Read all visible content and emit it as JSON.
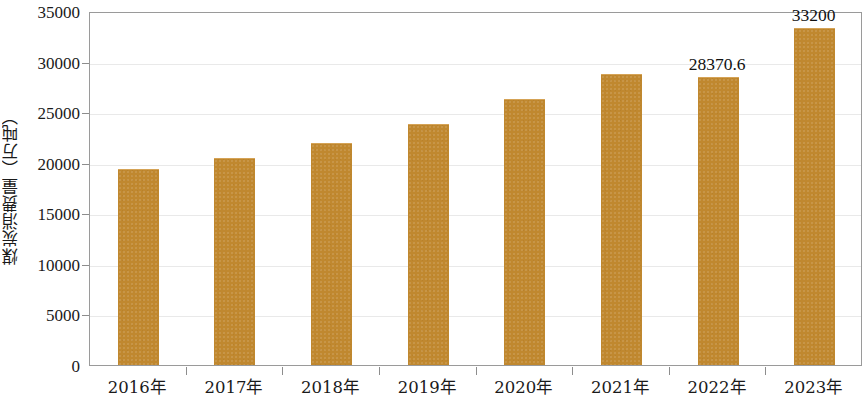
{
  "chart_data": {
    "type": "bar",
    "title": "",
    "xlabel": "",
    "ylabel": "煤炭消费量（万吨）",
    "categories": [
      "2016年",
      "2017年",
      "2018年",
      "2019年",
      "2020年",
      "2021年",
      "2022年",
      "2023年"
    ],
    "values": [
      19280,
      20360,
      21840,
      23740,
      26200,
      28700,
      28370.6,
      33200
    ],
    "data_labels": [
      "",
      "",
      "",
      "",
      "",
      "",
      "28370.6",
      "33200"
    ],
    "ylim": [
      0,
      35000
    ],
    "yticks": [
      0,
      5000,
      10000,
      15000,
      20000,
      25000,
      30000,
      35000
    ],
    "ytick_labels": [
      "0",
      "5000",
      "10000",
      "15000",
      "20000",
      "25000",
      "30000",
      "35000"
    ],
    "grid": true,
    "legend": false,
    "bar_color": "#c0882f",
    "gridline_color": "#e9e9e9",
    "axis_color": "#9a9a9a"
  }
}
